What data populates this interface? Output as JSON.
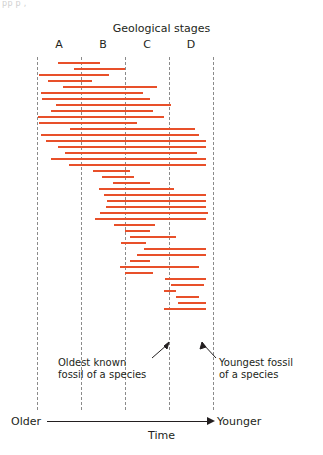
{
  "top_bleed_text": "pp        p  ,",
  "chart_data": {
    "type": "bar",
    "title": "Geological stages",
    "xlabel": "Time",
    "ylabel": "",
    "x_axis_left_label": "Older",
    "x_axis_right_label": "Younger",
    "orientation": "horizontal",
    "grid": "vertical dashed stage boundaries",
    "legend": "none",
    "xlim": [
      0,
      100
    ],
    "categories": [
      "A",
      "B",
      "C",
      "D"
    ],
    "stage_boundaries_pct": [
      0,
      25,
      50,
      75,
      100
    ],
    "annotations": [
      {
        "id": "oldest",
        "text_line1": "Oldest known",
        "text_line2": "fossil of a species",
        "points_to": "left end of a range bar"
      },
      {
        "id": "youngest",
        "text_line1": "Youngest fossil",
        "text_line2": "of a species",
        "points_to": "right end of a range bar"
      }
    ],
    "bar_color": "#e8502a",
    "bars": [
      {
        "start_pct": 12.0,
        "end_pct": 36.0
      },
      {
        "start_pct": 21.0,
        "end_pct": 50.0
      },
      {
        "start_pct": 1.0,
        "end_pct": 41.0
      },
      {
        "start_pct": 6.0,
        "end_pct": 31.0
      },
      {
        "start_pct": 15.0,
        "end_pct": 68.0
      },
      {
        "start_pct": 2.0,
        "end_pct": 60.0
      },
      {
        "start_pct": 3.0,
        "end_pct": 64.0
      },
      {
        "start_pct": 11.0,
        "end_pct": 76.0
      },
      {
        "start_pct": 8.0,
        "end_pct": 66.0
      },
      {
        "start_pct": 0.5,
        "end_pct": 72.0
      },
      {
        "start_pct": 1.0,
        "end_pct": 57.0
      },
      {
        "start_pct": 19.0,
        "end_pct": 90.0
      },
      {
        "start_pct": 2.0,
        "end_pct": 92.0
      },
      {
        "start_pct": 5.0,
        "end_pct": 96.0
      },
      {
        "start_pct": 12.0,
        "end_pct": 96.0
      },
      {
        "start_pct": 16.0,
        "end_pct": 91.0
      },
      {
        "start_pct": 8.0,
        "end_pct": 96.0
      },
      {
        "start_pct": 18.0,
        "end_pct": 96.0
      },
      {
        "start_pct": 32.0,
        "end_pct": 53.0
      },
      {
        "start_pct": 37.0,
        "end_pct": 55.0
      },
      {
        "start_pct": 43.0,
        "end_pct": 64.0
      },
      {
        "start_pct": 35.0,
        "end_pct": 78.0
      },
      {
        "start_pct": 38.0,
        "end_pct": 96.0
      },
      {
        "start_pct": 40.0,
        "end_pct": 96.0
      },
      {
        "start_pct": 39.0,
        "end_pct": 96.0
      },
      {
        "start_pct": 36.0,
        "end_pct": 97.0
      },
      {
        "start_pct": 33.0,
        "end_pct": 96.0
      },
      {
        "start_pct": 44.0,
        "end_pct": 67.0
      },
      {
        "start_pct": 50.0,
        "end_pct": 64.0
      },
      {
        "start_pct": 53.0,
        "end_pct": 79.0
      },
      {
        "start_pct": 48.0,
        "end_pct": 62.0
      },
      {
        "start_pct": 61.0,
        "end_pct": 96.0
      },
      {
        "start_pct": 57.0,
        "end_pct": 96.0
      },
      {
        "start_pct": 53.0,
        "end_pct": 64.0
      },
      {
        "start_pct": 47.0,
        "end_pct": 92.0
      },
      {
        "start_pct": 50.0,
        "end_pct": 66.0
      },
      {
        "start_pct": 73.0,
        "end_pct": 96.0
      },
      {
        "start_pct": 76.0,
        "end_pct": 95.0
      },
      {
        "start_pct": 72.0,
        "end_pct": 79.0
      },
      {
        "start_pct": 79.0,
        "end_pct": 92.0
      },
      {
        "start_pct": 80.0,
        "end_pct": 96.0
      },
      {
        "start_pct": 72.0,
        "end_pct": 96.0
      }
    ]
  }
}
